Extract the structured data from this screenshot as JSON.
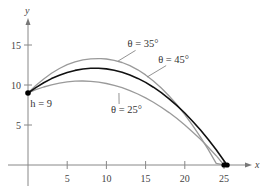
{
  "chart_data": {
    "type": "line",
    "title": "",
    "xlabel": "x",
    "ylabel": "y",
    "xlim": [
      -2.5,
      29
    ],
    "ylim": [
      -3,
      19.5
    ],
    "grid": false,
    "x_ticks": [
      5,
      10,
      15,
      20,
      25
    ],
    "y_ticks": [
      5,
      10,
      15
    ],
    "launch_point": {
      "x": 0,
      "y": 9,
      "label": "h = 9"
    },
    "series": [
      {
        "name": "θ = 35°",
        "color": "#9a9a9a",
        "width": 1.3,
        "x": [
          0,
          1,
          2,
          3,
          4,
          5,
          6,
          7,
          8,
          9,
          9.3,
          10,
          11,
          12,
          13,
          14,
          15,
          16,
          17,
          18,
          19,
          20,
          21,
          22,
          23,
          24,
          25
        ],
        "y": [
          9.0,
          9.94,
          10.76,
          11.47,
          12.06,
          12.54,
          12.9,
          13.15,
          13.28,
          13.3,
          13.3,
          13.25,
          13.09,
          12.81,
          12.41,
          11.9,
          11.26,
          10.51,
          9.63,
          8.63,
          7.53,
          6.3,
          4.96,
          3.49,
          1.91,
          0.21,
          -1.5
        ]
      },
      {
        "name": "θ = 45°",
        "color": "#111111",
        "width": 1.6,
        "x": [
          0,
          1,
          2,
          3,
          4,
          5,
          6,
          7,
          8,
          8.53,
          9,
          10,
          11,
          12,
          13,
          14,
          15,
          16,
          17,
          18,
          19,
          20,
          21,
          22,
          23,
          24,
          25,
          25.4
        ],
        "y": [
          9.0,
          9.68,
          10.28,
          10.8,
          11.22,
          11.57,
          11.83,
          12.0,
          12.09,
          12.1,
          12.09,
          12.01,
          11.84,
          11.59,
          11.25,
          10.83,
          10.32,
          9.72,
          9.04,
          8.28,
          7.43,
          6.5,
          5.48,
          4.37,
          3.18,
          1.9,
          0.54,
          0.0
        ]
      },
      {
        "name": "θ = 25°",
        "color": "#9a9a9a",
        "width": 1.3,
        "x": [
          0,
          1,
          2,
          3,
          4,
          5,
          6,
          6.86,
          7,
          8,
          9,
          10,
          11,
          12,
          13,
          14,
          15,
          16,
          17,
          18,
          19,
          20,
          21,
          22,
          23,
          24,
          25
        ],
        "y": [
          9.0,
          9.41,
          9.75,
          10.02,
          10.24,
          10.39,
          10.48,
          10.5,
          10.5,
          10.46,
          10.35,
          10.19,
          9.95,
          9.66,
          9.3,
          8.87,
          8.39,
          7.84,
          7.23,
          6.55,
          5.81,
          5.01,
          4.14,
          3.21,
          2.22,
          1.16,
          0.0
        ]
      }
    ],
    "landing_points": [
      {
        "x": 25.0,
        "y": 0
      },
      {
        "x": 25.4,
        "y": 0
      }
    ],
    "annotations": [
      {
        "text": "θ = 35°",
        "x": 12.7,
        "y": 14.7,
        "leader_to": {
          "x": 11.5,
          "y": 13.0
        }
      },
      {
        "text": "θ = 45°",
        "x": 16.6,
        "y": 12.8,
        "leader_to": {
          "x": 15.2,
          "y": 11.0
        }
      },
      {
        "text": "θ = 25°",
        "x": 10.6,
        "y": 6.5,
        "leader_to": {
          "x": 11.6,
          "y": 9.0
        }
      },
      {
        "text": "h = 9",
        "x": 0.3,
        "y": 7.2
      }
    ]
  }
}
